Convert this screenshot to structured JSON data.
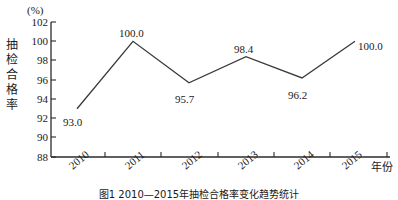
{
  "chart_data": {
    "type": "line",
    "title": "",
    "unit_label": "(%)",
    "xlabel": "年份",
    "ylabel": "抽检合格率",
    "ylabel_chars": [
      "抽",
      "检",
      "合",
      "格",
      "率"
    ],
    "categories": [
      "2010",
      "2011",
      "2012",
      "2013",
      "2014",
      "2015"
    ],
    "values": [
      93.0,
      100.0,
      95.7,
      98.4,
      96.2,
      100.0
    ],
    "point_labels": [
      "93.0",
      "100.0",
      "95.7",
      "98.4",
      "96.2",
      "100.0"
    ],
    "ylim": [
      88,
      102
    ],
    "ytick_labels": [
      "102",
      "100",
      "98",
      "96",
      "94",
      "92",
      "90",
      "88"
    ],
    "ytick_values": [
      102,
      100,
      98,
      96,
      94,
      92,
      90,
      88
    ],
    "grid": false,
    "legend": "none",
    "line_color": "#3a3a3a",
    "axis_color": "#2b2b2b"
  },
  "caption": "图1  2010—2015年抽检合格率变化趋势统计",
  "axis": {
    "unit": "(%)",
    "x_axis_name": "年份"
  }
}
